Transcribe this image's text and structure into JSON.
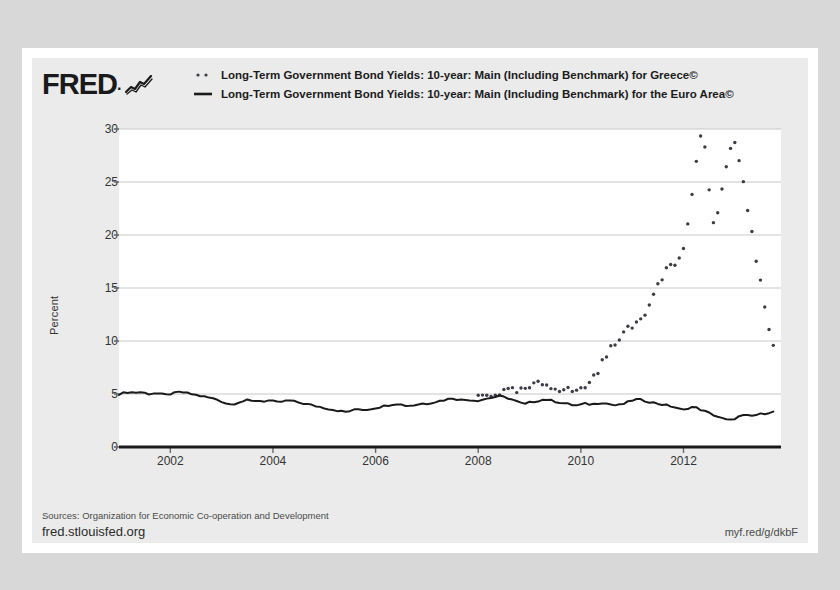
{
  "brand": {
    "name": "FRED",
    "dot": ".",
    "logo_icon": "fred-squiggle-icon"
  },
  "legend": [
    {
      "marker": "dotted",
      "label": "Long-Term Government Bond Yields: 10-year: Main (Including Benchmark) for Greece©"
    },
    {
      "marker": "solid",
      "label": "Long-Term Government Bond Yields: 10-year: Main (Including Benchmark) for the Euro Area©"
    }
  ],
  "footer": {
    "sources": "Sources: Organization for Economic Co-operation and Development",
    "site": "fred.stlouisfed.org",
    "short_url": "myf.red/g/dkbF"
  },
  "colors": {
    "series_greece": "#3c3c46",
    "series_euro": "#1a1a1a",
    "plot_bg": "#ffffff",
    "panel_bg": "#ebebeb",
    "grid": "#c8c8c8",
    "axis": "#1a1a1a",
    "text": "#333333"
  },
  "chart_data": {
    "type": "line",
    "title": "",
    "xlabel": "",
    "ylabel": "Percent",
    "grid": true,
    "legend_position": "top",
    "xlim": [
      2001.0,
      2013.9
    ],
    "ylim": [
      0,
      30
    ],
    "yticks": [
      0,
      5,
      10,
      15,
      20,
      25,
      30
    ],
    "xticks": [
      2002,
      2004,
      2006,
      2008,
      2010,
      2012
    ],
    "series": [
      {
        "name": "Long-Term Government Bond Yields: 10-year: Main (Including Benchmark) for Greece©",
        "style": "dotted",
        "x": [
          2008.0,
          2008.2,
          2008.4,
          2008.6,
          2008.8,
          2009.0,
          2009.2,
          2009.4,
          2009.6,
          2009.8,
          2010.0,
          2010.1,
          2010.2,
          2010.3,
          2010.4,
          2010.5,
          2010.6,
          2010.7,
          2010.8,
          2010.9,
          2011.0,
          2011.1,
          2011.2,
          2011.3,
          2011.4,
          2011.5,
          2011.6,
          2011.7,
          2011.8,
          2011.9,
          2012.0,
          2012.05,
          2012.1,
          2012.15,
          2012.2,
          2012.25,
          2012.3,
          2012.35,
          2012.4,
          2012.45,
          2012.5,
          2012.55,
          2012.6,
          2012.65,
          2012.7,
          2012.8,
          2012.9,
          2013.0,
          2013.1,
          2013.2,
          2013.3,
          2013.4,
          2013.5,
          2013.6,
          2013.7,
          2013.8
        ],
        "y": [
          4.8,
          4.9,
          5.1,
          5.3,
          5.2,
          5.6,
          6.0,
          5.8,
          5.5,
          5.3,
          5.4,
          5.8,
          6.3,
          7.0,
          7.8,
          8.6,
          9.4,
          10.2,
          10.6,
          11.0,
          11.3,
          11.8,
          12.4,
          13.1,
          14.3,
          15.7,
          16.2,
          17.1,
          17.0,
          17.8,
          18.5,
          20.3,
          21.7,
          23.2,
          25.0,
          26.6,
          28.2,
          29.5,
          28.9,
          27.0,
          24.6,
          22.3,
          20.5,
          21.4,
          23.2,
          25.6,
          27.8,
          28.4,
          26.9,
          24.2,
          21.0,
          18.2,
          15.4,
          12.8,
          10.6,
          8.9
        ],
        "marker": "dot"
      },
      {
        "name": "Long-Term Government Bond Yields: 10-year: Main (Including Benchmark) for the Euro Area©",
        "style": "solid",
        "x": [
          2001.0,
          2001.1,
          2001.2,
          2001.3,
          2001.4,
          2001.5,
          2001.6,
          2001.7,
          2001.8,
          2001.9,
          2002.0,
          2002.1,
          2002.2,
          2002.3,
          2002.4,
          2002.5,
          2002.6,
          2002.7,
          2002.8,
          2002.9,
          2003.0,
          2003.1,
          2003.2,
          2003.3,
          2003.4,
          2003.5,
          2003.6,
          2003.7,
          2003.8,
          2003.9,
          2004.0,
          2004.1,
          2004.2,
          2004.3,
          2004.4,
          2004.5,
          2004.6,
          2004.7,
          2004.8,
          2004.9,
          2005.0,
          2005.1,
          2005.2,
          2005.3,
          2005.4,
          2005.5,
          2005.6,
          2005.7,
          2005.8,
          2005.9,
          2006.0,
          2006.1,
          2006.2,
          2006.3,
          2006.4,
          2006.5,
          2006.6,
          2006.7,
          2006.8,
          2006.9,
          2007.0,
          2007.1,
          2007.2,
          2007.3,
          2007.4,
          2007.5,
          2007.6,
          2007.7,
          2007.8,
          2007.9,
          2008.0,
          2008.1,
          2008.2,
          2008.3,
          2008.4,
          2008.5,
          2008.6,
          2008.7,
          2008.8,
          2008.9,
          2009.0,
          2009.1,
          2009.2,
          2009.3,
          2009.4,
          2009.5,
          2009.6,
          2009.7,
          2009.8,
          2009.9,
          2010.0,
          2010.1,
          2010.2,
          2010.3,
          2010.4,
          2010.5,
          2010.6,
          2010.7,
          2010.8,
          2010.9,
          2011.0,
          2011.1,
          2011.2,
          2011.3,
          2011.4,
          2011.5,
          2011.6,
          2011.7,
          2011.8,
          2011.9,
          2012.0,
          2012.1,
          2012.2,
          2012.3,
          2012.4,
          2012.5,
          2012.6,
          2012.7,
          2012.8,
          2012.9,
          2013.0,
          2013.1,
          2013.2,
          2013.3,
          2013.4,
          2013.5,
          2013.6,
          2013.7,
          2013.8
        ],
        "y": [
          5.0,
          5.1,
          5.2,
          5.1,
          5.2,
          5.1,
          5.0,
          5.1,
          5.0,
          4.9,
          5.0,
          5.1,
          5.2,
          5.1,
          5.0,
          4.9,
          4.8,
          4.7,
          4.6,
          4.5,
          4.3,
          4.1,
          4.0,
          4.2,
          4.3,
          4.4,
          4.3,
          4.4,
          4.3,
          4.4,
          4.3,
          4.2,
          4.3,
          4.4,
          4.3,
          4.2,
          4.1,
          4.0,
          3.9,
          3.8,
          3.7,
          3.6,
          3.5,
          3.4,
          3.3,
          3.4,
          3.5,
          3.6,
          3.5,
          3.6,
          3.7,
          3.8,
          3.9,
          4.0,
          4.1,
          4.0,
          3.9,
          3.9,
          4.0,
          4.1,
          4.1,
          4.2,
          4.3,
          4.4,
          4.5,
          4.6,
          4.5,
          4.4,
          4.5,
          4.4,
          4.4,
          4.5,
          4.6,
          4.7,
          4.8,
          4.7,
          4.6,
          4.4,
          4.2,
          4.0,
          4.2,
          4.3,
          4.4,
          4.5,
          4.4,
          4.3,
          4.2,
          4.1,
          4.0,
          3.9,
          4.0,
          4.1,
          4.0,
          4.1,
          4.2,
          4.1,
          4.0,
          3.9,
          4.0,
          4.2,
          4.4,
          4.5,
          4.4,
          4.3,
          4.2,
          4.1,
          4.0,
          3.9,
          3.8,
          3.6,
          3.5,
          3.7,
          3.8,
          3.6,
          3.4,
          3.2,
          3.0,
          2.8,
          2.6,
          2.5,
          2.7,
          2.9,
          3.0,
          2.9,
          3.0,
          3.1,
          3.2,
          3.3,
          3.3
        ],
        "marker": "line"
      }
    ]
  }
}
